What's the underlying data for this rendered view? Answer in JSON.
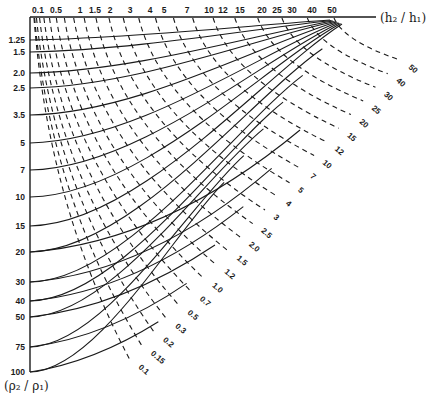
{
  "chart_data": {
    "type": "nomogram",
    "title": "",
    "x_axis": {
      "label": "(h2 / h1)",
      "position": "top",
      "ticks": [
        "0.1",
        "0.5",
        "1",
        "1.5",
        "2",
        "3",
        "4",
        "5",
        "7",
        "10",
        "12",
        "15",
        "20",
        "25",
        "30",
        "40",
        "50"
      ]
    },
    "y_axis": {
      "label": "(ρ2 / ρ1)",
      "position": "left",
      "direction": "downward",
      "ticks": [
        "1.25",
        "1.5",
        "2.0",
        "2.5",
        "3.5",
        "5",
        "7",
        "10",
        "15",
        "20",
        "30",
        "40",
        "50",
        "75",
        "100"
      ]
    },
    "solid_curves": {
      "description": "Curves of constant ρ2/ρ1, starting at left axis and sweeping up-right to converge near h2/h1 = 50 at the top axis",
      "values": [
        "1.25",
        "1.5",
        "2.0",
        "2.5",
        "3.5",
        "5",
        "7",
        "10",
        "15",
        "20",
        "30",
        "40",
        "50",
        "75",
        "100"
      ]
    },
    "dashed_curves": {
      "description": "Curves of constant second parameter, starting near top-left and running down-right, labelled along the lower-right diagonal edge",
      "labels": [
        "0.1",
        "0.15",
        "0.2",
        "0.3",
        "0.5",
        "0.7",
        "1.0",
        "1.2",
        "1.5",
        "2.0",
        "2.5",
        "3",
        "4",
        "5",
        "7",
        "10",
        "12",
        "15",
        "20",
        "25",
        "30",
        "40",
        "50"
      ]
    },
    "grid": false,
    "legend": "none"
  },
  "axes_text": {
    "x_title": "(h₂ / h₁)",
    "y_title": "(ρ₂ / ρ₁)"
  },
  "colors": {
    "ink": "#1a1a1a",
    "background": "#ffffff"
  }
}
